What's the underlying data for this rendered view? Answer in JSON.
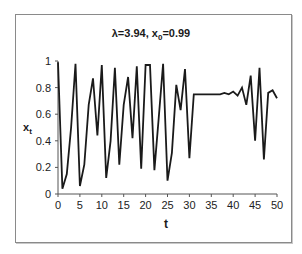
{
  "chart_data": {
    "type": "line",
    "title": "λ=3.94, x0=0.99",
    "title_parts": {
      "lambda": "λ=3.94, x",
      "sub": "0",
      "rest": "=0.99"
    },
    "xlabel": "t",
    "ylabel": {
      "base": "x",
      "sub": "t"
    },
    "xlim": [
      0,
      50
    ],
    "ylim": [
      0,
      1
    ],
    "xticks": [
      0,
      5,
      10,
      15,
      20,
      25,
      30,
      35,
      40,
      45,
      50
    ],
    "yticks": [
      0,
      0.2,
      0.4,
      0.6,
      0.8,
      1
    ],
    "ytick_labels": [
      "0",
      "0.2",
      "0.4",
      "0.6",
      "0.8",
      "1"
    ],
    "grid": false,
    "legend": null,
    "line_color": "#1a1a1a",
    "series": [
      {
        "name": "x_t",
        "x": [
          0,
          1,
          2,
          3,
          4,
          5,
          6,
          7,
          8,
          9,
          10,
          11,
          12,
          13,
          14,
          15,
          16,
          17,
          18,
          19,
          20,
          21,
          22,
          23,
          24,
          25,
          26,
          27,
          28,
          29,
          30,
          31,
          32,
          33,
          34,
          35,
          36,
          37,
          38,
          39,
          40,
          41,
          42,
          43,
          44,
          45,
          46,
          47,
          48,
          49,
          50
        ],
        "values": [
          0.99,
          0.04,
          0.15,
          0.5,
          0.98,
          0.06,
          0.22,
          0.67,
          0.87,
          0.44,
          0.97,
          0.12,
          0.4,
          0.95,
          0.22,
          0.67,
          0.88,
          0.42,
          0.96,
          0.19,
          0.97,
          0.97,
          0.18,
          0.57,
          0.98,
          0.1,
          0.31,
          0.82,
          0.63,
          0.94,
          0.27,
          0.75,
          0.75,
          0.75,
          0.75,
          0.75,
          0.75,
          0.75,
          0.76,
          0.75,
          0.77,
          0.74,
          0.8,
          0.67,
          0.89,
          0.4,
          0.95,
          0.26,
          0.76,
          0.78,
          0.72
        ]
      }
    ]
  }
}
